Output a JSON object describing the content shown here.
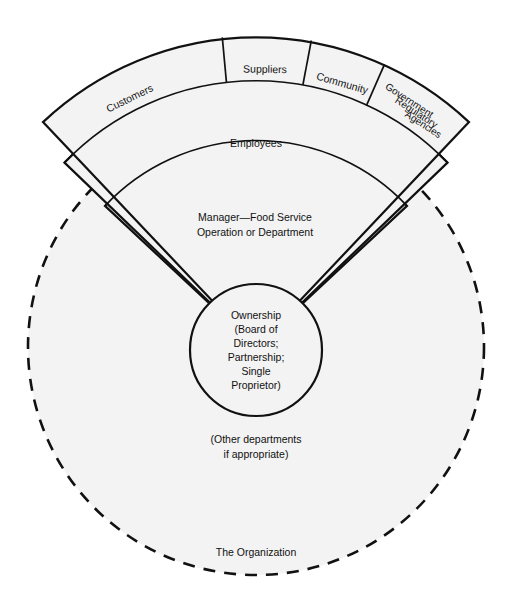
{
  "diagram": {
    "title_text": "The Organization",
    "colors": {
      "fill": "#f3f3f3",
      "stroke": "#111111",
      "background": "#ffffff"
    },
    "outer_ring": {
      "name": "external-stakeholders-ring",
      "segments": [
        {
          "id": "customers",
          "label": "Customers"
        },
        {
          "id": "suppliers",
          "label": "Suppliers"
        },
        {
          "id": "community",
          "label": "Community"
        },
        {
          "id": "government",
          "label_line1": "Government",
          "label_line2": "Regulatory",
          "label_line3": "Agencies"
        }
      ]
    },
    "middle_ring": {
      "name": "employees-ring",
      "label": "Employees"
    },
    "inner_ring": {
      "name": "manager-ring",
      "label_line1": "Manager—Food Service",
      "label_line2": "Operation or Department"
    },
    "core": {
      "name": "ownership-circle",
      "label_line1": "Ownership",
      "label_line2": "(Board of",
      "label_line3": "Directors;",
      "label_line4": "Partnership;",
      "label_line5": "Single",
      "label_line6": "Proprietor)"
    },
    "other_departments": {
      "label_line1": "(Other departments",
      "label_line2": "if appropriate)"
    },
    "organization_boundary": {
      "name": "organization-dashed-boundary",
      "label": "The Organization"
    }
  }
}
